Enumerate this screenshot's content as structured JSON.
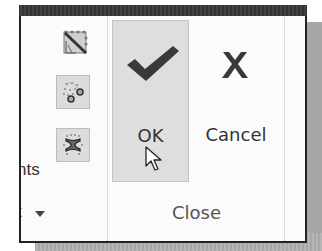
{
  "ribbon": {
    "left_group": {
      "partial_label_1": "nts",
      "partial_label_2": "t",
      "icons": [
        {
          "name": "edge-diagonal-grid-icon"
        },
        {
          "name": "node-path-icon"
        },
        {
          "name": "i-beam-snap-icon"
        }
      ],
      "dropdown_icon": "chevron-down-icon"
    },
    "close_group": {
      "label": "Close",
      "ok": {
        "label": "OK",
        "icon": "checkmark-icon",
        "state": "hover"
      },
      "cancel": {
        "label": "Cancel",
        "icon": "x-icon"
      }
    }
  },
  "colors": {
    "frame_border": "#222222",
    "titlebar": "#333333",
    "button_hover_bg": "#dedede",
    "icon_dark": "#3a3a3a",
    "shadow": "#a8a8a8"
  }
}
